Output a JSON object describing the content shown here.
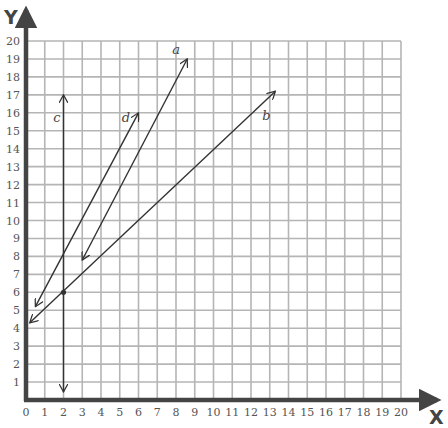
{
  "chart_data": {
    "type": "line",
    "title": "",
    "xlabel": "X",
    "ylabel": "Y",
    "xlim": [
      0,
      20
    ],
    "ylim": [
      0,
      20
    ],
    "grid": true,
    "x_ticks": [
      "0",
      "1",
      "2",
      "3",
      "4",
      "5",
      "6",
      "7",
      "8",
      "9",
      "10",
      "11",
      "12",
      "13",
      "14",
      "15",
      "16",
      "17",
      "18",
      "19",
      "20"
    ],
    "y_ticks": [
      "1",
      "2",
      "3",
      "4",
      "5",
      "6",
      "7",
      "8",
      "9",
      "10",
      "11",
      "12",
      "13",
      "14",
      "15",
      "16",
      "17",
      "18",
      "19",
      "20"
    ],
    "series": [
      {
        "name": "a",
        "points": [
          [
            3,
            7.8
          ],
          [
            8.6,
            19
          ]
        ],
        "arrows": "both",
        "label_pos": [
          7.8,
          19.3
        ]
      },
      {
        "name": "b",
        "points": [
          [
            0.2,
            4.3
          ],
          [
            13.3,
            17.2
          ]
        ],
        "arrows": "both",
        "label_pos": [
          12.6,
          15.6
        ]
      },
      {
        "name": "c",
        "points": [
          [
            2,
            0.45
          ],
          [
            2,
            17
          ]
        ],
        "arrows": "both",
        "label_pos": [
          1.45,
          15.5
        ]
      },
      {
        "name": "d",
        "points": [
          [
            0.5,
            5.2
          ],
          [
            6,
            16
          ]
        ],
        "arrows": "both",
        "label_pos": [
          5.1,
          15.5
        ]
      }
    ],
    "annotations": [
      {
        "type": "point",
        "x": 2,
        "y": 6
      }
    ]
  }
}
